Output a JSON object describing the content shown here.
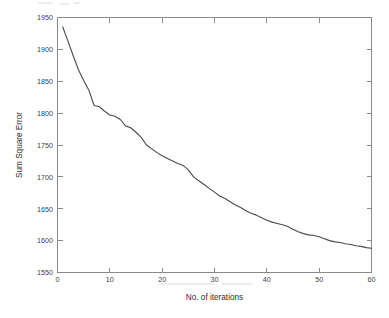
{
  "chart_data": {
    "type": "line",
    "title": "",
    "xlabel": "No. of iterations",
    "ylabel": "Sum Square Error",
    "xlim": [
      0,
      60
    ],
    "ylim": [
      1550,
      1950
    ],
    "xticks": [
      0,
      10,
      20,
      30,
      40,
      50,
      60
    ],
    "yticks": [
      1550,
      1600,
      1650,
      1700,
      1750,
      1800,
      1850,
      1900,
      1950
    ],
    "xtick_labels": [
      "0",
      "10",
      "20",
      "30",
      "40",
      "50",
      "60"
    ],
    "ytick_labels": [
      "1550",
      "1600",
      "1650",
      "1700",
      "1750",
      "1800",
      "1850",
      "1900",
      "1950"
    ],
    "grid": false,
    "legend": false,
    "line_color": "#4a4a4a",
    "axis_color": "#8a8a8a",
    "background": "#ffffff",
    "series": [
      {
        "name": "Sum Square Error",
        "x": [
          1,
          2,
          3,
          4,
          5,
          6,
          7,
          8,
          9,
          10,
          11,
          12,
          13,
          14,
          15,
          16,
          17,
          18,
          19,
          20,
          21,
          22,
          23,
          24,
          25,
          26,
          27,
          28,
          29,
          30,
          31,
          32,
          33,
          34,
          35,
          36,
          37,
          38,
          39,
          40,
          41,
          42,
          43,
          44,
          45,
          46,
          47,
          48,
          49,
          50,
          51,
          52,
          53,
          54,
          55,
          56,
          57,
          58,
          59,
          60
        ],
        "values": [
          1935,
          1913,
          1890,
          1868,
          1851,
          1836,
          1812,
          1810,
          1803,
          1797,
          1795,
          1790,
          1780,
          1777,
          1770,
          1762,
          1750,
          1744,
          1738,
          1733,
          1729,
          1725,
          1721,
          1718,
          1711,
          1700,
          1694,
          1688,
          1682,
          1676,
          1670,
          1666,
          1661,
          1656,
          1652,
          1647,
          1643,
          1640,
          1636,
          1632,
          1629,
          1627,
          1625,
          1622,
          1618,
          1614,
          1611,
          1609,
          1608,
          1606,
          1603,
          1600,
          1598,
          1597,
          1595,
          1594,
          1592,
          1591,
          1589,
          1588
        ]
      }
    ]
  },
  "axes": {
    "x_title": "No. of iterations",
    "y_title": "Sum Square Error"
  }
}
